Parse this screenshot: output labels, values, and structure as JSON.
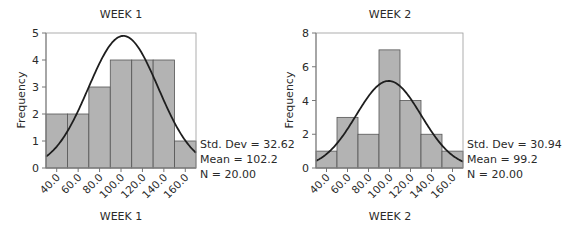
{
  "colors": {
    "bar_fill": "#b3b3b3",
    "bar_stroke": "#555555",
    "curve": "#1e1e1e",
    "axis": "#777777",
    "frame": "#999999"
  },
  "chart_data": [
    {
      "type": "bar",
      "subtype": "histogram_with_normal_curve",
      "title": "WEEK 1",
      "xlabel": "WEEK 1",
      "ylabel": "Frequency",
      "categories": [
        "40.0",
        "60.0",
        "80.0",
        "100.0",
        "120.0",
        "140.0",
        "160.0"
      ],
      "bin_edges": [
        30,
        50,
        70,
        90,
        110,
        130,
        150,
        170
      ],
      "values": [
        2,
        2,
        3,
        4,
        4,
        4,
        1
      ],
      "ylim": [
        0,
        5
      ],
      "yticks": [
        0,
        1,
        2,
        3,
        4,
        5
      ],
      "xlim": [
        30,
        170
      ],
      "grid": false,
      "stats": {
        "std_dev_label": "Std. Dev = 32.62",
        "mean_label": "Mean = 102.2",
        "n_label": "N = 20.00",
        "std_dev": 32.62,
        "mean": 102.2,
        "n": 20
      }
    },
    {
      "type": "bar",
      "subtype": "histogram_with_normal_curve",
      "title": "WEEK 2",
      "xlabel": "WEEK 2",
      "ylabel": "Frequency",
      "categories": [
        "40.0",
        "60.0",
        "80.0",
        "100.0",
        "120.0",
        "140.0",
        "160.0"
      ],
      "bin_edges": [
        30,
        50,
        70,
        90,
        110,
        130,
        150,
        170
      ],
      "values": [
        1,
        3,
        2,
        7,
        4,
        2,
        1
      ],
      "ylim": [
        0,
        8
      ],
      "yticks": [
        0,
        2,
        4,
        6,
        8
      ],
      "xlim": [
        30,
        170
      ],
      "grid": false,
      "stats": {
        "std_dev_label": "Std. Dev = 30.94",
        "mean_label": "Mean = 99.2",
        "n_label": "N = 20.00",
        "std_dev": 30.94,
        "mean": 99.2,
        "n": 20
      }
    }
  ]
}
